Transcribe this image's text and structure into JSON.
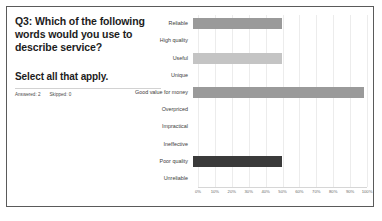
{
  "card": {
    "question_title": "Q3: Which of the following words would you use to describe service?",
    "select_instruction": "Select all that apply.",
    "answered_label": "Answered: 2",
    "skipped_label": "Skipped: 0"
  },
  "colors": {
    "card_border": "#5a5a5a",
    "bar_medium_gray": "#9a9a9a",
    "bar_light_gray": "#c4c4c4",
    "bar_dark_gray": "#3a3a3a",
    "gridline": "#ececec",
    "text_primary": "#1c1c1c",
    "text_muted": "#6b6b6b"
  },
  "chart_data": {
    "type": "bar",
    "orientation": "horizontal",
    "title": "",
    "xlabel": "",
    "ylabel": "",
    "xlim": [
      0,
      100
    ],
    "grid": true,
    "legend": "none",
    "categories": [
      "Reliable",
      "High quality",
      "Useful",
      "Unique",
      "Good value for money",
      "Overpriced",
      "Impractical",
      "Ineffective",
      "Poor quality",
      "Unreliable"
    ],
    "values": [
      51,
      0,
      51,
      0,
      98,
      0,
      0,
      0,
      51,
      0
    ],
    "bar_colors": [
      "#9a9a9a",
      "#9a9a9a",
      "#c4c4c4",
      "#9a9a9a",
      "#9a9a9a",
      "#9a9a9a",
      "#9a9a9a",
      "#9a9a9a",
      "#3a3a3a",
      "#9a9a9a"
    ],
    "tick_values": [
      0,
      10,
      20,
      30,
      40,
      50,
      60,
      70,
      80,
      90,
      100
    ],
    "tick_labels": [
      "0%",
      "10%",
      "20%",
      "30%",
      "40%",
      "50%",
      "60%",
      "70%",
      "80%",
      "90%",
      "100%"
    ]
  }
}
